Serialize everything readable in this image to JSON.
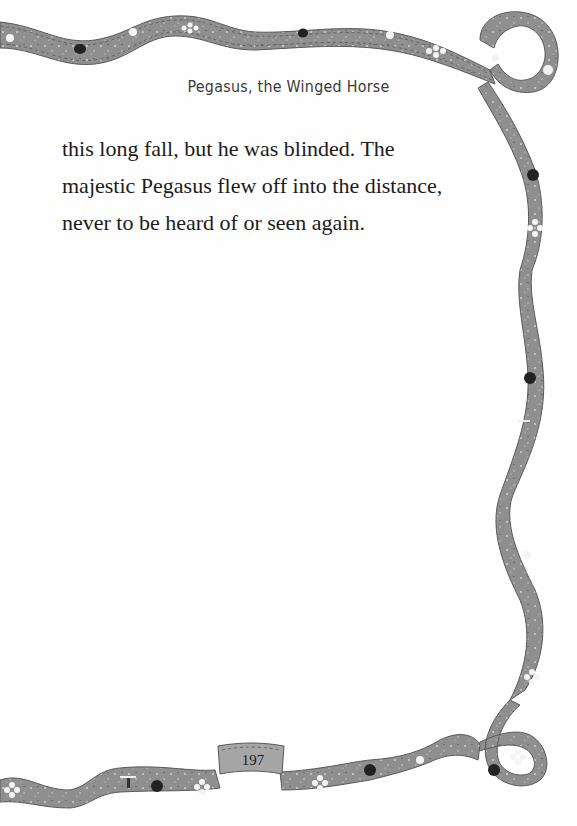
{
  "running_head": "Pegasus, the Winged Horse",
  "body": {
    "lines": [
      "this long fall, but he was blinded. The",
      "majestic Pegasus flew off into the distance,",
      "never to be heard of or seen again."
    ]
  },
  "page_number": "197",
  "border": {
    "style": "decorative-ribbon",
    "ribbon_color": "#8e8e8e",
    "ribbon_edge_color": "#5a5a5a",
    "motifs": [
      "flower-icon",
      "ladybug-icon",
      "dragonfly-icon",
      "bird-icon",
      "leaf-icon"
    ]
  }
}
